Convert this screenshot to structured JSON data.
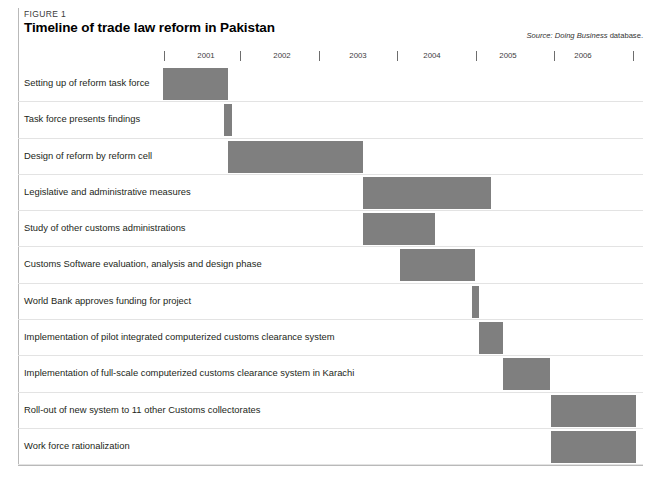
{
  "figure": {
    "label": "FIGURE 1",
    "title": "Timeline of trade law reform in Pakistan",
    "source_prefix": "Source:",
    "source_italic": "Doing Business",
    "source_suffix": "database.",
    "bar_color": "#7f7f7f",
    "rule_color": "#b9b9b9",
    "separator_color": "#e3e3e3"
  },
  "chart_data": {
    "type": "bar",
    "subtype": "gantt",
    "title": "Timeline of trade law reform in Pakistan",
    "xlabel": "",
    "ylabel": "",
    "xlim": [
      2001,
      2007
    ],
    "grid": false,
    "legend": "none",
    "axis": {
      "tick_labels": [
        "2001",
        "2002",
        "2003",
        "2004",
        "2005",
        "2006"
      ],
      "tick_values": [
        2001,
        2002,
        2003,
        2004,
        2005,
        2006
      ],
      "tick_marks": [
        2001,
        2002,
        2003,
        2004,
        2005,
        2006,
        2007
      ]
    },
    "categories": [
      "Setting up of reform task force",
      "Task force presents findings",
      "Design of reform by reform cell",
      "Legislative and administrative measures",
      "Study of other customs administrations",
      "Customs Software evaluation, analysis and design phase",
      "World Bank approves funding for project",
      "Implementation of pilot integrated computerized customs clearance system",
      "Implementation of full-scale computerized customs clearance system in Karachi",
      "Roll-out of new system to 11 other Customs collectorates",
      "Work force rationalization"
    ],
    "bars": [
      {
        "task": "Setting up of reform task force",
        "start": 2001.0,
        "end": 2001.82
      },
      {
        "task": "Task force presents findings",
        "start": 2001.77,
        "end": 2001.87
      },
      {
        "task": "Design of reform by reform cell",
        "start": 2001.82,
        "end": 2003.53
      },
      {
        "task": "Legislative and administrative measures",
        "start": 2003.53,
        "end": 2005.15
      },
      {
        "task": "Study of other customs administrations",
        "start": 2003.53,
        "end": 2004.44
      },
      {
        "task": "Customs Software evaluation, analysis and design phase",
        "start": 2004.0,
        "end": 2004.95
      },
      {
        "task": "World Bank approves funding for project",
        "start": 2004.92,
        "end": 2005.0
      },
      {
        "task": "Implementation of pilot integrated computerized customs clearance system",
        "start": 2005.0,
        "end": 2005.3
      },
      {
        "task": "Implementation of full-scale computerized customs clearance system in Karachi",
        "start": 2005.31,
        "end": 2005.91
      },
      {
        "task": "Roll-out of new system to 11 other Customs collectorates",
        "start": 2005.92,
        "end": 2007.0
      },
      {
        "task": "Work force rationalization",
        "start": 2005.92,
        "end": 2007.0
      }
    ]
  },
  "rows": [
    {
      "label": "Setting up of reform task force",
      "bar_left": 163,
      "bar_width": 65
    },
    {
      "label": "Task force presents findings",
      "bar_left": 224,
      "bar_width": 8
    },
    {
      "label": "Design of reform by reform cell",
      "bar_left": 228,
      "bar_width": 135
    },
    {
      "label": "Legislative and administrative measures",
      "bar_left": 363,
      "bar_width": 128
    },
    {
      "label": "Study of other customs administrations",
      "bar_left": 363,
      "bar_width": 72
    },
    {
      "label": "Customs Software evaluation, analysis and design phase",
      "bar_left": 400,
      "bar_width": 75
    },
    {
      "label": "World Bank approves funding for project",
      "bar_left": 472,
      "bar_width": 7
    },
    {
      "label": "Implementation of pilot integrated computerized customs clearance system",
      "bar_left": 479,
      "bar_width": 24
    },
    {
      "label": "Implementation of full-scale computerized customs clearance system in Karachi",
      "bar_left": 503,
      "bar_width": 47
    },
    {
      "label": "Roll-out of new system to 11 other Customs collectorates",
      "bar_left": 551,
      "bar_width": 85
    },
    {
      "label": "Work force rationalization",
      "bar_left": 551,
      "bar_width": 85
    }
  ],
  "axis_years": [
    {
      "label": "2001",
      "label_left": 176,
      "tick_left": 164
    },
    {
      "label": "2002",
      "label_left": 252,
      "tick_left": 240
    },
    {
      "label": "2003",
      "label_left": 328,
      "tick_left": 319
    },
    {
      "label": "2004",
      "label_left": 402,
      "tick_left": 397
    },
    {
      "label": "2005",
      "label_left": 478,
      "tick_left": 476
    },
    {
      "label": "2006",
      "label_left": 553,
      "tick_left": 554
    },
    {
      "label": "",
      "label_left": 0,
      "tick_left": 633
    }
  ]
}
